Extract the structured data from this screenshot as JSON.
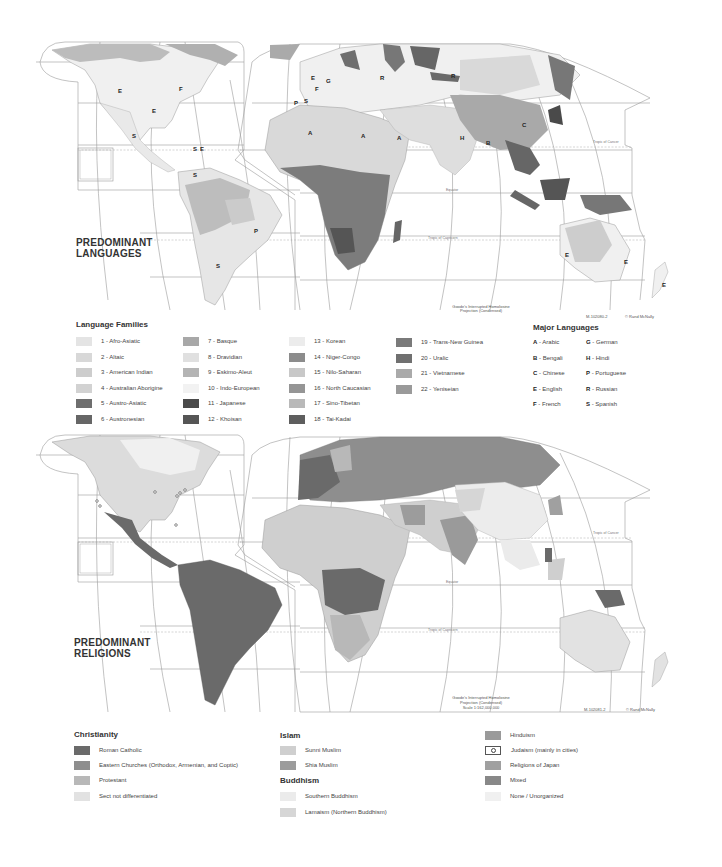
{
  "languages_map": {
    "title_line1": "PREDOMINANT",
    "title_line2": "LANGUAGES",
    "projection_line1": "Goode's Interrupted Homolosine",
    "projection_line2": "Projection (Condensed)",
    "projection_line3": "Scale 1:162,000,000",
    "map_id": "M-102080-2",
    "credit": "© Rand McNally",
    "tropic_cancer": "Tropic of Cancer",
    "tropic_capricorn": "Tropic of Capricorn",
    "equator": "Equator",
    "region_labels": [
      "E",
      "F",
      "E",
      "S",
      "S",
      "E",
      "S",
      "P",
      "S",
      "E",
      "G",
      "F",
      "P",
      "S",
      "A",
      "A",
      "A",
      "R",
      "R",
      "H",
      "B",
      "C",
      "E",
      "E",
      "E"
    ]
  },
  "language_families": {
    "title": "Language Families",
    "items": [
      {
        "label": "1 - Afro-Asiatic",
        "color": "#e4e4e4"
      },
      {
        "label": "2 - Altaic",
        "color": "#d8d8d8"
      },
      {
        "label": "3 - American Indian",
        "color": "#cdcdcd"
      },
      {
        "label": "4 - Australian Aborigine",
        "color": "#d2d2d2"
      },
      {
        "label": "5 - Austro-Asiatic",
        "color": "#6e6e6e"
      },
      {
        "label": "6 - Austronesian",
        "color": "#666666"
      },
      {
        "label": "7 - Basque",
        "color": "#a8a8a8"
      },
      {
        "label": "8 - Dravidian",
        "color": "#e0e0e0"
      },
      {
        "label": "9 - Eskimo-Aleut",
        "color": "#b4b4b4"
      },
      {
        "label": "10 - Indo-European",
        "color": "#f2f2f2"
      },
      {
        "label": "11 - Japanese",
        "color": "#4a4a4a"
      },
      {
        "label": "12 - Khoisan",
        "color": "#555555"
      },
      {
        "label": "13 - Korean",
        "color": "#ececec"
      },
      {
        "label": "14 - Niger-Congo",
        "color": "#8c8c8c"
      },
      {
        "label": "15 - Nilo-Saharan",
        "color": "#c8c8c8"
      },
      {
        "label": "16 - North Caucasian",
        "color": "#959595"
      },
      {
        "label": "17 - Sino-Tibetan",
        "color": "#b9b9b9"
      },
      {
        "label": "18 - Tai-Kadai",
        "color": "#5e5e5e"
      },
      {
        "label": "19 - Trans-New Guinea",
        "color": "#7a7a7a"
      },
      {
        "label": "20 - Uralic",
        "color": "#707070"
      },
      {
        "label": "21 - Vietnamese",
        "color": "#aaaaaa"
      },
      {
        "label": "22 - Yeniseian",
        "color": "#9a9a9a"
      }
    ]
  },
  "major_languages": {
    "title": "Major Languages",
    "items": [
      {
        "code": "A",
        "name": "Arabic"
      },
      {
        "code": "B",
        "name": "Bengali"
      },
      {
        "code": "C",
        "name": "Chinese"
      },
      {
        "code": "E",
        "name": "English"
      },
      {
        "code": "F",
        "name": "French"
      },
      {
        "code": "G",
        "name": "German"
      },
      {
        "code": "H",
        "name": "Hindi"
      },
      {
        "code": "P",
        "name": "Portuguese"
      },
      {
        "code": "R",
        "name": "Russian"
      },
      {
        "code": "S",
        "name": "Spanish"
      }
    ]
  },
  "religions_map": {
    "title_line1": "PREDOMINANT",
    "title_line2": "RELIGIONS",
    "projection_line1": "Goode's Interrupted Homolosine",
    "projection_line2": "Projection (Condensed)",
    "projection_line3": "Scale 1:162,000,000",
    "map_id": "M-102081-2",
    "credit": "© Rand McNally",
    "tropic_cancer": "Tropic of Cancer",
    "tropic_capricorn": "Tropic of Capricorn",
    "equator": "Equator"
  },
  "religions_legend": {
    "christianity": {
      "title": "Christianity",
      "items": [
        {
          "label": "Roman Catholic",
          "color": "#6a6a6a"
        },
        {
          "label": "Eastern Churches (Orthodox, Armenian, and Coptic)",
          "color": "#8e8e8e"
        },
        {
          "label": "Protestant",
          "color": "#b8b8b8"
        },
        {
          "label": "Sect not differentiated",
          "color": "#e2e2e2"
        }
      ]
    },
    "islam": {
      "title": "Islam",
      "items": [
        {
          "label": "Sunni Muslim",
          "color": "#cfcfcf"
        },
        {
          "label": "Shia Muslim",
          "color": "#9c9c9c"
        }
      ]
    },
    "buddhism": {
      "title": "Buddhism",
      "items": [
        {
          "label": "Southern Buddhism",
          "color": "#ebebeb"
        },
        {
          "label": "Lamaism (Northern Buddhism)",
          "color": "#d6d6d6"
        }
      ]
    },
    "other": {
      "items": [
        {
          "label": "Hinduism",
          "color": "#9a9a9a"
        },
        {
          "label": "Judaism (mainly in cities)",
          "color": "#ffffff"
        },
        {
          "label": "Religions of Japan",
          "color": "#a0a0a0"
        },
        {
          "label": "Mixed",
          "color": "#888888"
        },
        {
          "label": "None / Unorganized",
          "color": "#f0f0f0"
        }
      ]
    }
  }
}
